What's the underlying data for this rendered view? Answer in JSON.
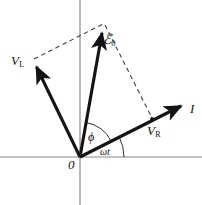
{
  "figure": {
    "type": "phasor-diagram",
    "title": "",
    "background_color": "#ffffff",
    "axis_color": "#8a8a8a",
    "vector_color": "#141414",
    "dashed_color": "#4a4a4a",
    "width": 202,
    "height": 205
  },
  "labels": {
    "v_l": "V",
    "v_l_sub": "L",
    "emf": "ℰ",
    "emf_sub": "0",
    "current": "I",
    "v_r": "V",
    "v_r_sub": "R",
    "phi": "ϕ",
    "omega_t": "ωt",
    "origin": "0"
  },
  "geometry": {
    "origin": {
      "x": 80,
      "y": 157
    },
    "x_axis": {
      "x1": 0,
      "y1": 157,
      "x2": 202,
      "y2": 157
    },
    "y_axis": {
      "x1": 80,
      "y1": 0,
      "x2": 80,
      "y2": 205
    },
    "vectors": [
      {
        "name": "V_L",
        "label": "V_L",
        "from": {
          "x": 80,
          "y": 157
        },
        "to": {
          "x": 33,
          "y": 60
        },
        "style": "solid",
        "arrow": true
      },
      {
        "name": "emf",
        "label": "ℰ_0",
        "from": {
          "x": 80,
          "y": 157
        },
        "to": {
          "x": 104,
          "y": 23
        },
        "style": "solid",
        "arrow": true
      },
      {
        "name": "I",
        "label": "I",
        "from": {
          "x": 80,
          "y": 157
        },
        "to": {
          "x": 189,
          "y": 102
        },
        "style": "solid",
        "arrow": true
      }
    ],
    "dashed_lines": [
      {
        "name": "vl-to-emf",
        "from": {
          "x": 34,
          "y": 59
        },
        "to": {
          "x": 103,
          "y": 24
        },
        "style": "dashed"
      },
      {
        "name": "emf-to-vr",
        "from": {
          "x": 105,
          "y": 25
        },
        "to": {
          "x": 152,
          "y": 119
        },
        "style": "dashed"
      }
    ],
    "markers": [
      {
        "name": "v_r-point",
        "x": 152,
        "y": 119
      }
    ],
    "arcs": [
      {
        "name": "phi-arc",
        "center": {
          "x": 80,
          "y": 157
        },
        "radius": 35,
        "start_angle_deg": 26.8,
        "end_angle_deg": 79.8,
        "label": "ϕ"
      },
      {
        "name": "omega-t-arc",
        "center": {
          "x": 80,
          "y": 157
        },
        "radius": 44,
        "start_angle_deg": 0,
        "end_angle_deg": 26.8,
        "label": "ωt"
      }
    ]
  }
}
